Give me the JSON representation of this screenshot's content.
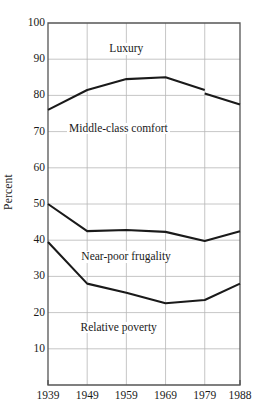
{
  "chart_data": {
    "type": "line",
    "title": "",
    "subtitle": "",
    "xlabel": "",
    "ylabel": "Percent",
    "x": [
      "1939",
      "1949",
      "1959",
      "1969",
      "1979",
      "1988"
    ],
    "categories": [
      "1939",
      "1949",
      "1959",
      "1969",
      "1979",
      "1988"
    ],
    "xlim": [
      1939,
      1988
    ],
    "ylim": [
      0,
      100
    ],
    "yticks": [
      100,
      90,
      80,
      70,
      60,
      50,
      40,
      30,
      20,
      10
    ],
    "grid": true,
    "legend_position": "inline-annotations",
    "series": [
      {
        "name": "Luxury / Middle-class comfort boundary",
        "values": [
          76.0,
          81.5,
          84.5,
          85.0,
          81.5,
          77.5
        ],
        "note": "small discontinuity at 1979: line drops from 81.5 to 80.5",
        "values_post_break": [
          null,
          null,
          null,
          null,
          80.5,
          77.5
        ]
      },
      {
        "name": "Middle-class comfort / Near-poor frugality boundary",
        "values": [
          50.0,
          42.5,
          42.8,
          42.3,
          39.8,
          42.5
        ]
      },
      {
        "name": "Near-poor frugality / Relative poverty boundary",
        "values": [
          39.5,
          28.0,
          25.5,
          22.6,
          23.5,
          28.0
        ]
      }
    ],
    "annotations": [
      {
        "text": "Luxury",
        "x": 1959,
        "y": 92.5
      },
      {
        "text": "Middle-class comfort",
        "x": 1957,
        "y": 70.5
      },
      {
        "text": "Near-poor frugality",
        "x": 1959,
        "y": 35.0
      },
      {
        "text": "Relative poverty",
        "x": 1957,
        "y": 15.5
      }
    ],
    "colors": {
      "line": "#1a1a1a",
      "grid": "#b8b8b8",
      "frame": "#555555",
      "background": "#ffffff",
      "text": "#1a1a1a"
    }
  }
}
